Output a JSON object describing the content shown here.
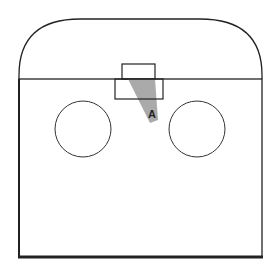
{
  "diagram": {
    "label": "A",
    "colors": {
      "stroke": "#222222",
      "wedge": "#aaaaaa",
      "background": "#ffffff"
    }
  }
}
